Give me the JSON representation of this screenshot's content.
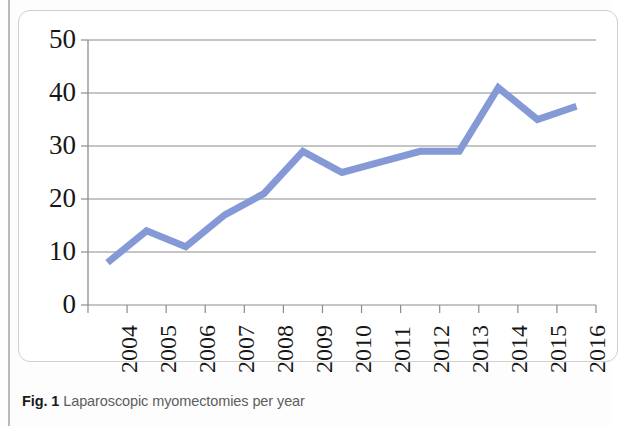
{
  "figure": {
    "caption_label": "Fig. 1",
    "caption_text": "Laparoscopic myomectomies per year"
  },
  "colors": {
    "series_line": "#8599d6",
    "gridline": "#8c8c8c",
    "axis": "#8c8c8c",
    "frame": "#cfcfcf",
    "rule": "#b9b9b9",
    "caption_label": "#1a1a1a",
    "caption_text": "#5d5d5d",
    "tick_text": "#171717",
    "background": "#ffffff"
  },
  "chart_data": {
    "type": "line",
    "title": "",
    "subtitle": "",
    "xlabel": "",
    "ylabel": "",
    "categories": [
      "2004",
      "2005",
      "2006",
      "2007",
      "2008",
      "2009",
      "2010",
      "2011",
      "2012",
      "2013",
      "2014",
      "2015",
      "2016"
    ],
    "values": [
      8,
      14,
      11,
      17,
      21,
      29,
      25,
      27,
      29,
      29,
      41,
      35,
      37.5
    ],
    "series": [
      {
        "name": "Laparoscopic myomectomies",
        "values": [
          8,
          14,
          11,
          17,
          21,
          29,
          25,
          27,
          29,
          29,
          41,
          35,
          37.5
        ]
      }
    ],
    "ylim": [
      0,
      50
    ],
    "ytick_labels": [
      "0",
      "10",
      "20",
      "30",
      "40",
      "50"
    ],
    "ytick_values": [
      0,
      10,
      20,
      30,
      40,
      50
    ],
    "xtick_labels": [
      "2004",
      "2005",
      "2006",
      "2007",
      "2008",
      "2009",
      "2010",
      "2011",
      "2012",
      "2013",
      "2014",
      "2015",
      "2016"
    ],
    "grid": true,
    "grid_axis": "y",
    "legend": false,
    "legend_position": "none",
    "marker": "none",
    "line_width": 7,
    "xtick_rotation": -90
  }
}
